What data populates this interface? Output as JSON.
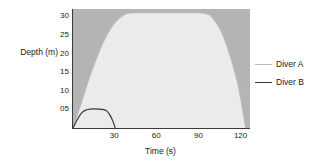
{
  "chart_data": {
    "type": "area",
    "title": "",
    "xlabel": "Time (s)",
    "ylabel": "Depth (m)",
    "xlim": [
      0,
      126
    ],
    "ylim": [
      0,
      32
    ],
    "grid": false,
    "legend_position": "right",
    "xticks": [
      {
        "value": 30,
        "label": "30"
      },
      {
        "value": 60,
        "label": "60"
      },
      {
        "value": 90,
        "label": "90"
      },
      {
        "value": 120,
        "label": "120"
      }
    ],
    "yticks": [
      {
        "value": 30,
        "label": "30"
      },
      {
        "value": 25,
        "label": "25"
      },
      {
        "value": 20,
        "label": "20"
      },
      {
        "value": 15,
        "label": "15"
      },
      {
        "value": 10,
        "label": "10"
      },
      {
        "value": 5,
        "label": "05"
      }
    ],
    "colors": {
      "plot_background": "#b4b4b4",
      "area_fill": "#ebebeb",
      "diver_a_line": "#b9b9b9",
      "diver_b_line": "#3a3a3a",
      "axis": "#3a3a3a",
      "text": "#1a1a1a",
      "page_background": "#ffffff"
    },
    "series": [
      {
        "name": "Diver A",
        "line_color": "#b9b9b9",
        "filled": true,
        "x": [
          0,
          6,
          12,
          18,
          24,
          30,
          36,
          42,
          60,
          78,
          90,
          96,
          99,
          105,
          111,
          117,
          121,
          123
        ],
        "y": [
          0,
          7,
          14,
          20,
          25,
          28.5,
          30.4,
          31,
          31,
          31,
          31,
          30.6,
          29.8,
          26.5,
          20.5,
          12.5,
          4.5,
          0
        ]
      },
      {
        "name": "Diver B",
        "line_color": "#3a3a3a",
        "filled": true,
        "x": [
          0,
          3,
          6,
          9,
          12,
          18,
          21,
          24,
          27,
          29,
          30
        ],
        "y": [
          0,
          2.2,
          4.0,
          4.8,
          5.1,
          5.1,
          5.0,
          4.6,
          3.0,
          1.2,
          0
        ]
      }
    ]
  },
  "legend": {
    "items": [
      {
        "label": "Diver A",
        "color": "#b9b9b9"
      },
      {
        "label": "Diver B",
        "color": "#3a3a3a"
      }
    ]
  }
}
